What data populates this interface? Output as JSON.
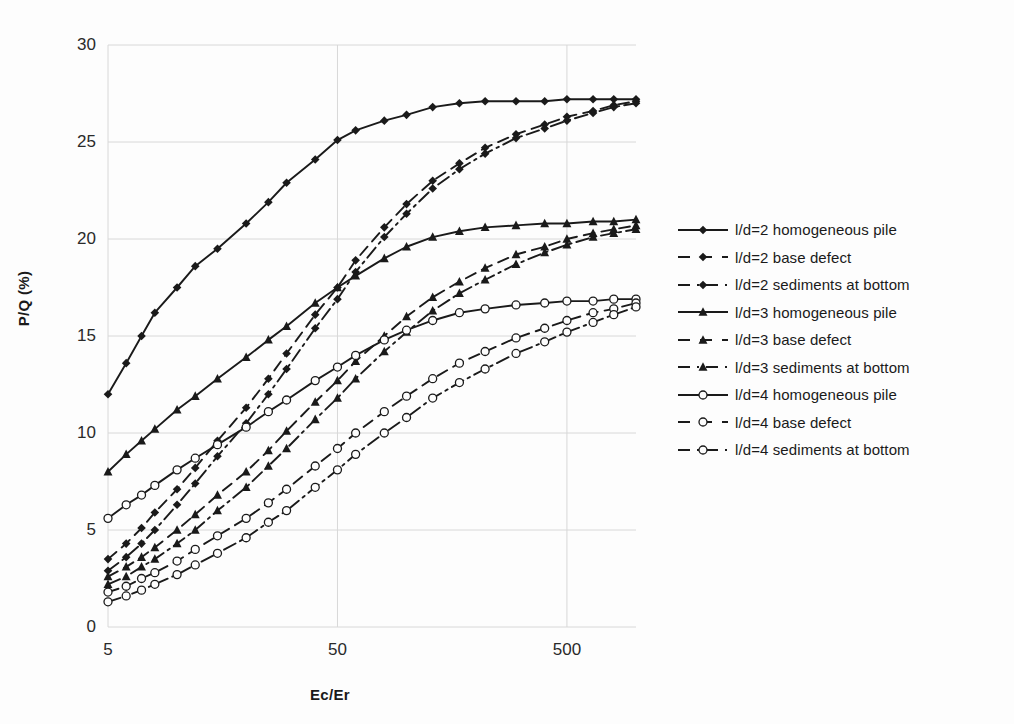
{
  "chart_data": {
    "type": "line",
    "title": "",
    "xlabel": "Ec/Er",
    "ylabel": "P/Q (%)",
    "xscale": "log",
    "xlim": [
      5,
      1000
    ],
    "ylim": [
      0,
      30
    ],
    "yticks": [
      0,
      5,
      10,
      15,
      20,
      25,
      30
    ],
    "xticks": [
      5,
      50,
      500
    ],
    "xtick_labels": [
      "5",
      "50",
      "500"
    ],
    "ytick_labels": [
      "0",
      "5",
      "10",
      "15",
      "20",
      "25",
      "30"
    ],
    "grid": "light horizontal gridlines at y ticks and light vertical gridlines at x ticks",
    "legend_position": "right",
    "x": [
      5,
      6,
      7,
      8,
      10,
      12,
      15,
      20,
      25,
      30,
      40,
      50,
      60,
      80,
      100,
      130,
      170,
      220,
      300,
      400,
      500,
      650,
      800,
      1000
    ],
    "series": [
      {
        "name": "l/d=2 homogeneous pile",
        "marker": "filled-diamond",
        "line": "solid",
        "values": [
          12.0,
          13.6,
          15.0,
          16.2,
          17.5,
          18.6,
          19.5,
          20.8,
          21.9,
          22.9,
          24.1,
          25.1,
          25.6,
          26.1,
          26.4,
          26.8,
          27.0,
          27.1,
          27.1,
          27.1,
          27.2,
          27.2,
          27.2,
          27.2
        ]
      },
      {
        "name": "l/d=2 base defect",
        "marker": "filled-diamond",
        "line": "dashed",
        "values": [
          3.5,
          4.3,
          5.1,
          5.9,
          7.1,
          8.2,
          9.6,
          11.3,
          12.8,
          14.1,
          16.1,
          17.5,
          18.9,
          20.6,
          21.8,
          23.0,
          23.9,
          24.7,
          25.4,
          25.9,
          26.3,
          26.6,
          26.9,
          27.1
        ]
      },
      {
        "name": "l/d=2 sediments at bottom",
        "marker": "filled-diamond",
        "line": "dash-dot",
        "values": [
          2.9,
          3.6,
          4.3,
          5.0,
          6.3,
          7.4,
          8.8,
          10.5,
          12.0,
          13.3,
          15.4,
          16.9,
          18.3,
          20.1,
          21.3,
          22.6,
          23.6,
          24.4,
          25.2,
          25.7,
          26.1,
          26.5,
          26.8,
          27.0
        ]
      },
      {
        "name": "l/d=3 homogeneous pile",
        "marker": "filled-triangle",
        "line": "solid",
        "values": [
          8.0,
          8.9,
          9.6,
          10.2,
          11.2,
          11.9,
          12.8,
          13.9,
          14.8,
          15.5,
          16.7,
          17.5,
          18.1,
          19.0,
          19.6,
          20.1,
          20.4,
          20.6,
          20.7,
          20.8,
          20.8,
          20.9,
          20.9,
          21.0
        ]
      },
      {
        "name": "l/d=3 base defect",
        "marker": "filled-triangle",
        "line": "dashed",
        "values": [
          2.6,
          3.1,
          3.6,
          4.1,
          5.0,
          5.8,
          6.8,
          8.0,
          9.1,
          10.1,
          11.6,
          12.7,
          13.7,
          15.0,
          16.0,
          17.0,
          17.8,
          18.5,
          19.2,
          19.6,
          20.0,
          20.3,
          20.5,
          20.7
        ]
      },
      {
        "name": "l/d=3 sediments at bottom",
        "marker": "filled-triangle",
        "line": "dash-dot",
        "values": [
          2.2,
          2.6,
          3.1,
          3.5,
          4.3,
          5.0,
          6.0,
          7.2,
          8.3,
          9.2,
          10.7,
          11.8,
          12.8,
          14.2,
          15.2,
          16.3,
          17.2,
          17.9,
          18.7,
          19.3,
          19.7,
          20.1,
          20.3,
          20.5
        ]
      },
      {
        "name": "l/d=4  homogeneous pile",
        "marker": "open-circle",
        "line": "solid",
        "values": [
          5.6,
          6.3,
          6.8,
          7.3,
          8.1,
          8.7,
          9.4,
          10.3,
          11.1,
          11.7,
          12.7,
          13.4,
          14.0,
          14.8,
          15.3,
          15.8,
          16.2,
          16.4,
          16.6,
          16.7,
          16.8,
          16.8,
          16.9,
          16.9
        ]
      },
      {
        "name": "l/d=4 base defect",
        "marker": "open-circle-dash",
        "line": "dashed",
        "values": [
          1.8,
          2.1,
          2.5,
          2.8,
          3.4,
          4.0,
          4.7,
          5.6,
          6.4,
          7.1,
          8.3,
          9.2,
          10.0,
          11.1,
          11.9,
          12.8,
          13.6,
          14.2,
          14.9,
          15.4,
          15.8,
          16.2,
          16.4,
          16.7
        ]
      },
      {
        "name": "l/d=4 sediments at bottom",
        "marker": "open-circle",
        "line": "dash-dot",
        "values": [
          1.3,
          1.6,
          1.9,
          2.2,
          2.7,
          3.2,
          3.8,
          4.6,
          5.4,
          6.0,
          7.2,
          8.1,
          8.9,
          10.0,
          10.8,
          11.8,
          12.6,
          13.3,
          14.1,
          14.7,
          15.2,
          15.7,
          16.1,
          16.5
        ]
      }
    ]
  },
  "colors": {
    "ink": "#1a1a1a",
    "grid": "#d8d8d8",
    "background": "#fdfdfd"
  }
}
